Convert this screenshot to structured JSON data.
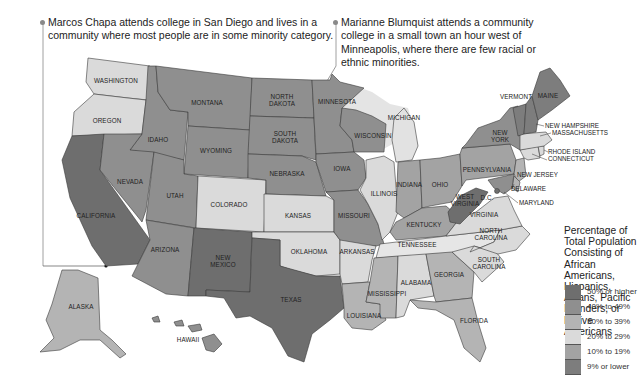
{
  "callouts": {
    "marcos": "Marcos Chapa attends college in San Diego and lives in a community where most people are in some minority category.",
    "marianne": "Marianne Blumquist attends a community college in a small town an hour west of Minneapolis, where there are few racial or ethnic minorities."
  },
  "legend": {
    "title": "Percentage of Total Population Consisting of African Americans, Hispanics, Asians, Pacific Islanders, or Native Americans",
    "items": [
      {
        "label": "50% or higher",
        "color": "#6e6e6e"
      },
      {
        "label": "40% to 49%",
        "color": "#8f8f8f"
      },
      {
        "label": "30% to 39%",
        "color": "#b4b4b4"
      },
      {
        "label": "20% to 29%",
        "color": "#dadada"
      },
      {
        "label": "10% to 19%",
        "color": "#a3a3a3"
      },
      {
        "label": "9% or lower",
        "color": "#7d7d7d"
      }
    ]
  },
  "states": {
    "washington": "WASHINGTON",
    "oregon": "OREGON",
    "california": "CALIFORNIA",
    "idaho": "IDAHO",
    "nevada": "NEVADA",
    "montana": "MONTANA",
    "wyoming": "WYOMING",
    "utah": "UTAH",
    "colorado": "COLORADO",
    "arizona": "ARIZONA",
    "new_mexico_1": "NEW",
    "new_mexico_2": "MEXICO",
    "north_dakota_1": "NORTH",
    "north_dakota_2": "DAKOTA",
    "south_dakota_1": "SOUTH",
    "south_dakota_2": "DAKOTA",
    "nebraska": "NEBRASKA",
    "kansas": "KANSAS",
    "oklahoma": "OKLAHOMA",
    "texas": "TEXAS",
    "minnesota": "MINNESOTA",
    "iowa": "IOWA",
    "missouri": "MISSOURI",
    "arkansas": "ARKANSAS",
    "louisiana": "LOUISIANA",
    "wisconsin": "WISCONSIN",
    "illinois": "ILLINOIS",
    "michigan": "MICHIGAN",
    "indiana": "INDIANA",
    "ohio": "OHIO",
    "kentucky": "KENTUCKY",
    "tennessee": "TENNESSEE",
    "mississippi": "MISSISSIPPI",
    "alabama": "ALABAMA",
    "georgia": "GEORGIA",
    "florida": "FLORIDA",
    "south_carolina_1": "SOUTH",
    "south_carolina_2": "CAROLINA",
    "north_carolina_1": "NORTH",
    "north_carolina_2": "CAROLINA",
    "virginia": "VIRGINIA",
    "west_virginia_1": "WEST",
    "west_virginia_2": "VIRGINIA",
    "dc": "D.C.",
    "pennsylvania": "PENNSYLVANIA",
    "new_york_1": "NEW",
    "new_york_2": "YORK",
    "vermont": "VERMONT",
    "maine": "MAINE",
    "new_hampshire": "NEW HAMPSHIRE",
    "massachusetts": "MASSACHUSETTS",
    "rhode_island": "RHODE ISLAND",
    "connecticut": "CONNECTICUT",
    "new_jersey": "NEW JERSEY",
    "delaware": "DELAWARE",
    "maryland": "MARYLAND",
    "alaska": "ALASKA",
    "hawaii": "HAWAII"
  }
}
